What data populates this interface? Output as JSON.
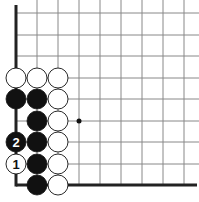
{
  "board": {
    "grid_lines_x": [
      16,
      37,
      58,
      79,
      100,
      121,
      142,
      163,
      184
    ],
    "grid_lines_y": [
      13,
      35,
      56,
      78,
      99,
      121,
      142,
      164,
      185
    ],
    "edge_left_x": 16,
    "edge_bottom_y": 185,
    "star_point": {
      "x": 79,
      "y": 121
    },
    "line_color": "#888888",
    "edge_color": "#222222"
  },
  "stones": [
    {
      "color": "white",
      "x": 16,
      "y": 78,
      "label": ""
    },
    {
      "color": "white",
      "x": 37,
      "y": 78,
      "label": ""
    },
    {
      "color": "white",
      "x": 58,
      "y": 78,
      "label": ""
    },
    {
      "color": "black",
      "x": 16,
      "y": 99,
      "label": ""
    },
    {
      "color": "black",
      "x": 37,
      "y": 99,
      "label": ""
    },
    {
      "color": "white",
      "x": 58,
      "y": 99,
      "label": ""
    },
    {
      "color": "black",
      "x": 37,
      "y": 121,
      "label": ""
    },
    {
      "color": "white",
      "x": 58,
      "y": 121,
      "label": ""
    },
    {
      "color": "black",
      "x": 16,
      "y": 142,
      "label": "2"
    },
    {
      "color": "black",
      "x": 37,
      "y": 142,
      "label": ""
    },
    {
      "color": "white",
      "x": 58,
      "y": 142,
      "label": ""
    },
    {
      "color": "white",
      "x": 16,
      "y": 164,
      "label": "1"
    },
    {
      "color": "black",
      "x": 37,
      "y": 164,
      "label": ""
    },
    {
      "color": "white",
      "x": 58,
      "y": 164,
      "label": ""
    },
    {
      "color": "black",
      "x": 37,
      "y": 185,
      "label": ""
    },
    {
      "color": "white",
      "x": 58,
      "y": 185,
      "label": ""
    }
  ]
}
